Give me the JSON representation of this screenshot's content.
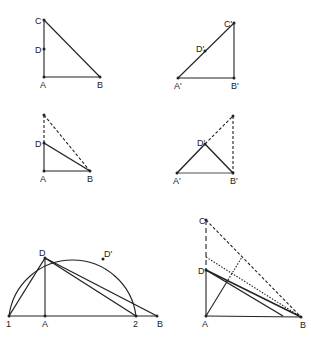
{
  "panels": [
    {
      "id": "p1",
      "points": {
        "C": "C",
        "D": "D",
        "A": "A",
        "B": "B"
      }
    },
    {
      "id": "p2",
      "points": {
        "C": "C'",
        "D": "D'",
        "A": "A'",
        "B": "B'"
      }
    },
    {
      "id": "p3",
      "points": {
        "D": "D",
        "A": "A",
        "B": "B"
      }
    },
    {
      "id": "p4",
      "points": {
        "D": "D'",
        "A": "A'",
        "B": "B'"
      }
    },
    {
      "id": "p5",
      "points": {
        "D": "D",
        "Dp": "D'",
        "one": "1",
        "A": "A",
        "two": "2",
        "B": "B"
      }
    },
    {
      "id": "p6",
      "points": {
        "C": "C",
        "D": "D",
        "A": "A",
        "B": "B"
      }
    }
  ],
  "colors": {
    "stroke": "#222222",
    "background": "#ffffff"
  }
}
